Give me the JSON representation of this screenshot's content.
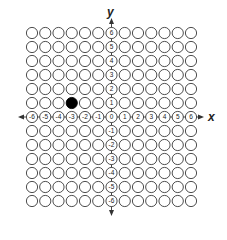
{
  "diagram": {
    "type": "coordinate-grid-bubbles",
    "x_axis_label": "x",
    "y_axis_label": "y",
    "x_range": [
      -6,
      6
    ],
    "y_range": [
      -6,
      6
    ],
    "x_tick_labels": [
      "-6",
      "-5",
      "-4",
      "-3",
      "-2",
      "-1",
      "0",
      "1",
      "2",
      "3",
      "4",
      "5",
      "6"
    ],
    "y_tick_labels": [
      "6",
      "5",
      "4",
      "3",
      "2",
      "1",
      "-1",
      "-2",
      "-3",
      "-4",
      "-5",
      "-6"
    ],
    "filled_points": [
      {
        "x": -3,
        "y": 1
      }
    ],
    "colors": {
      "outline": "#3a3a3a",
      "fill_selected": "#000000",
      "background": "#ffffff"
    }
  }
}
